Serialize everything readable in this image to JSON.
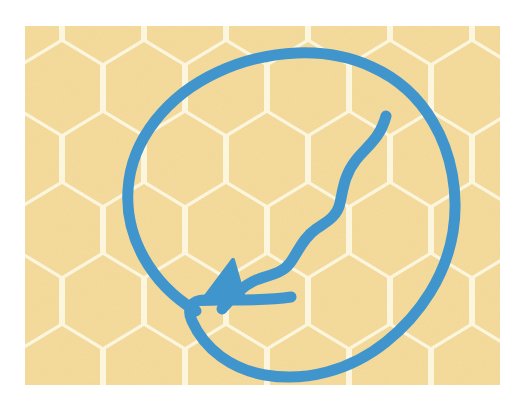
{
  "canvas": {
    "width": 526,
    "height": 408,
    "background_color": "#FFFFFF",
    "title": "Wavy arrow looping inside a circle over a honeycomb background"
  },
  "artboard": {
    "x": 25,
    "y": 26,
    "width": 475,
    "height": 359,
    "label": "illustration-artboard"
  },
  "background": {
    "type": "honeycomb-hexagon-tiling",
    "cell_fill_color": "#F5DB9A",
    "grout_color": "#FFF8E0",
    "orientation": "pointy-top",
    "cell_width": 82,
    "cell_height": 94,
    "row_step": 71,
    "gap": 7,
    "noise": "subtle paper grain"
  },
  "marks": {
    "stroke_color": "#4095CD",
    "stroke_width": 11,
    "linecap": "round",
    "linejoin": "round",
    "ellipse": {
      "name": "hand-drawn-oval",
      "center_x": 288,
      "center_y": 212,
      "radius_x": 168,
      "radius_y": 150,
      "rotation_deg": -22,
      "closure_overlap_point": [
        195,
        313
      ],
      "description": "slightly lumpy hand drawn oval, open/overlapping at lower-left"
    },
    "wavy_arrow": {
      "name": "squiggle-arrow",
      "start_point": [
        386,
        116
      ],
      "end_point": [
        201,
        303
      ],
      "tip_point": [
        201,
        303
      ],
      "waves": 3,
      "direction": "down-left",
      "arrowhead": {
        "type": "filled-triangle",
        "length": 46,
        "width": 40,
        "angle_deg": 228
      }
    }
  },
  "colors": {
    "honey": "#F5DB9A",
    "cream": "#FFF8E0",
    "blue": "#4095CD",
    "white": "#FFFFFF"
  }
}
